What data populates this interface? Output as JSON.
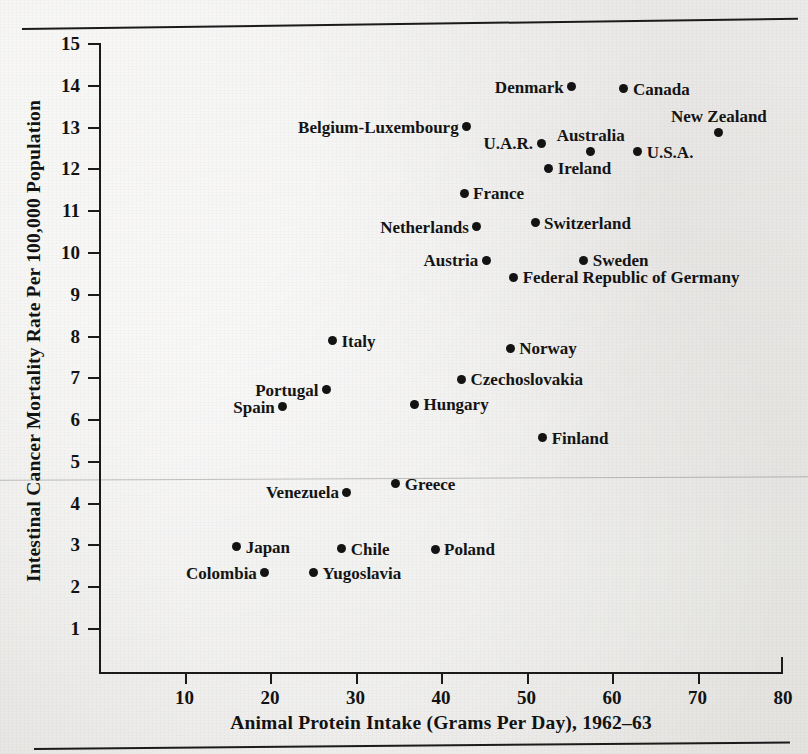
{
  "chart_data": {
    "type": "scatter",
    "title": "",
    "xlabel": "Animal Protein Intake (Grams Per Day), 1962–63",
    "ylabel": "Intestinal Cancer Mortality Rate Per 100,000 Population",
    "xlim": [
      0,
      80
    ],
    "ylim": [
      0,
      15
    ],
    "xticks": [
      10,
      20,
      30,
      40,
      50,
      60,
      70,
      80
    ],
    "yticks": [
      1,
      2,
      3,
      4,
      5,
      6,
      7,
      8,
      9,
      10,
      11,
      12,
      13,
      14,
      15
    ],
    "grid": false,
    "legend": "none",
    "marker_color": "#131313",
    "points": [
      {
        "label": "Denmark",
        "x": 55.3,
        "y": 13.95,
        "label_pos": "left"
      },
      {
        "label": "Canada",
        "x": 61.4,
        "y": 13.9,
        "label_pos": "right"
      },
      {
        "label": "Belgium-Luxembourg",
        "x": 43.0,
        "y": 13.0,
        "label_pos": "left"
      },
      {
        "label": "New Zealand",
        "x": 72.5,
        "y": 12.85,
        "label_pos": "above"
      },
      {
        "label": "U.A.R.",
        "x": 51.7,
        "y": 12.6,
        "label_pos": "left"
      },
      {
        "label": "Australia",
        "x": 57.5,
        "y": 12.4,
        "label_pos": "above"
      },
      {
        "label": "U.S.A.",
        "x": 63.0,
        "y": 12.4,
        "label_pos": "right"
      },
      {
        "label": "Ireland",
        "x": 52.6,
        "y": 12.0,
        "label_pos": "right"
      },
      {
        "label": "France",
        "x": 42.7,
        "y": 11.4,
        "label_pos": "right"
      },
      {
        "label": "Switzerland",
        "x": 51.0,
        "y": 10.7,
        "label_pos": "right"
      },
      {
        "label": "Netherlands",
        "x": 44.2,
        "y": 10.6,
        "label_pos": "left"
      },
      {
        "label": "Austria",
        "x": 45.3,
        "y": 9.8,
        "label_pos": "left"
      },
      {
        "label": "Sweden",
        "x": 56.7,
        "y": 9.8,
        "label_pos": "right"
      },
      {
        "label": "Federal Republic of Germany",
        "x": 48.5,
        "y": 9.4,
        "label_pos": "right"
      },
      {
        "label": "Italy",
        "x": 27.3,
        "y": 7.87,
        "label_pos": "right"
      },
      {
        "label": "Norway",
        "x": 48.1,
        "y": 7.7,
        "label_pos": "right"
      },
      {
        "label": "Czechoslovakia",
        "x": 42.4,
        "y": 6.95,
        "label_pos": "right"
      },
      {
        "label": "Portugal",
        "x": 26.6,
        "y": 6.7,
        "label_pos": "left"
      },
      {
        "label": "Spain",
        "x": 21.5,
        "y": 6.3,
        "label_pos": "left"
      },
      {
        "label": "Hungary",
        "x": 36.9,
        "y": 6.35,
        "label_pos": "right"
      },
      {
        "label": "Finland",
        "x": 51.9,
        "y": 5.55,
        "label_pos": "right"
      },
      {
        "label": "Greece",
        "x": 34.7,
        "y": 4.45,
        "label_pos": "right"
      },
      {
        "label": "Venezuela",
        "x": 29.0,
        "y": 4.25,
        "label_pos": "left"
      },
      {
        "label": "Japan",
        "x": 16.1,
        "y": 2.95,
        "label_pos": "right"
      },
      {
        "label": "Chile",
        "x": 28.4,
        "y": 2.9,
        "label_pos": "right"
      },
      {
        "label": "Poland",
        "x": 39.3,
        "y": 2.88,
        "label_pos": "right"
      },
      {
        "label": "Colombia",
        "x": 19.4,
        "y": 2.32,
        "label_pos": "left"
      },
      {
        "label": "Yugoslavia",
        "x": 25.1,
        "y": 2.32,
        "label_pos": "right"
      }
    ]
  }
}
